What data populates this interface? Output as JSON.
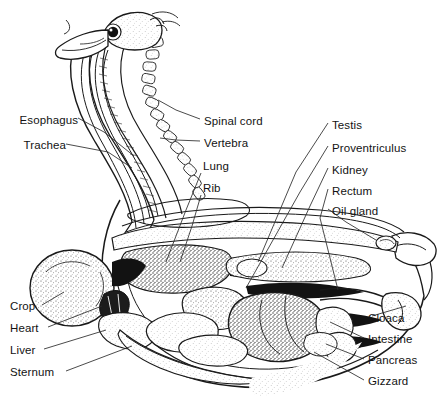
{
  "figure": {
    "style": "black-and-white stipple line drawing",
    "background_color": "#ffffff",
    "ink_color": "#1a1a1a",
    "label_color": "#131313"
  },
  "labels": {
    "esophagus": "Esophagus",
    "trachea": "Trachea",
    "spinal_cord": "Spinal cord",
    "vertebra": "Vertebra",
    "lung": "Lung",
    "rib": "Rib",
    "testis": "Testis",
    "proventriculus": "Proventriculus",
    "kidney": "Kidney",
    "rectum": "Rectum",
    "oil_gland": "Oil gland",
    "cloaca": "Cloaca",
    "intestine": "Intestine",
    "pancreas": "Pancreas",
    "gizzard": "Gizzard",
    "crop": "Crop",
    "heart": "Heart",
    "liver": "Liver",
    "sternum": "Sternum"
  },
  "label_list": [
    {
      "key": "esophagus",
      "text": "Esophagus",
      "side": "left",
      "x": 18,
      "y": 122
    },
    {
      "key": "trachea",
      "text": "Trachea",
      "side": "left",
      "x": 18,
      "y": 147
    },
    {
      "key": "spinal_cord",
      "text": "Spinal cord",
      "side": "right",
      "x": 204,
      "y": 123
    },
    {
      "key": "vertebra",
      "text": "Vertebra",
      "side": "right",
      "x": 204,
      "y": 145
    },
    {
      "key": "lung",
      "text": "Lung",
      "side": "right",
      "x": 203,
      "y": 168
    },
    {
      "key": "rib",
      "text": "Rib",
      "side": "right",
      "x": 203,
      "y": 190
    },
    {
      "key": "testis",
      "text": "Testis",
      "side": "right",
      "x": 332,
      "y": 127
    },
    {
      "key": "proventriculus",
      "text": "Proventriculus",
      "side": "right",
      "x": 332,
      "y": 150
    },
    {
      "key": "kidney",
      "text": "Kidney",
      "side": "right",
      "x": 332,
      "y": 172
    },
    {
      "key": "rectum",
      "text": "Rectum",
      "side": "right",
      "x": 332,
      "y": 193
    },
    {
      "key": "oil_gland",
      "text": "Oil gland",
      "side": "right",
      "x": 332,
      "y": 213
    },
    {
      "key": "cloaca",
      "text": "Cloaca",
      "side": "right",
      "x": 368,
      "y": 320
    },
    {
      "key": "intestine",
      "text": "Intestine",
      "side": "right",
      "x": 368,
      "y": 341
    },
    {
      "key": "pancreas",
      "text": "Pancreas",
      "side": "right",
      "x": 368,
      "y": 362
    },
    {
      "key": "gizzard",
      "text": "Gizzard",
      "side": "right",
      "x": 368,
      "y": 383
    },
    {
      "key": "crop",
      "text": "Crop",
      "side": "left",
      "x": 10,
      "y": 308
    },
    {
      "key": "heart",
      "text": "Heart",
      "side": "left",
      "x": 10,
      "y": 330
    },
    {
      "key": "liver",
      "text": "Liver",
      "side": "left",
      "x": 10,
      "y": 352
    },
    {
      "key": "sternum",
      "text": "Sternum",
      "side": "left",
      "x": 10,
      "y": 374
    }
  ],
  "anatomy_parts": [
    "head",
    "eye",
    "bill",
    "neck",
    "cervical vertebrae",
    "trachea",
    "esophagus",
    "spinal cord",
    "crop",
    "heart",
    "liver",
    "sternum",
    "ribs",
    "lung",
    "proventriculus",
    "gizzard",
    "pancreas",
    "intestine",
    "kidney",
    "testis",
    "rectum",
    "cloaca",
    "oil gland",
    "tail"
  ]
}
